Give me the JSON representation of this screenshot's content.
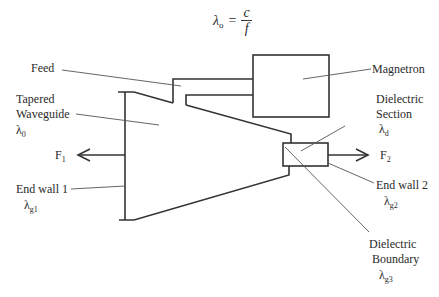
{
  "equation": {
    "lhs_symbol": "λ",
    "lhs_subscript": "o",
    "equals": "=",
    "numerator": "c",
    "denominator": "f"
  },
  "labels": {
    "feed": "Feed",
    "magnetron": "Magnetron",
    "tapered_waveguide_line1": "Tapered",
    "tapered_waveguide_line2": "Waveguide",
    "tapered_waveguide_symbol": "λ",
    "tapered_waveguide_sub": "0",
    "dielectric_section_line1": "Dielectric",
    "dielectric_section_line2": "Section",
    "dielectric_section_symbol": "λ",
    "dielectric_section_sub": "d",
    "f1": "F",
    "f1_sub": "1",
    "f2": "F",
    "f2_sub": "2",
    "end_wall_1": "End wall 1",
    "end_wall_1_symbol": "λ",
    "end_wall_1_sub": "g1",
    "end_wall_2": "End wall 2",
    "end_wall_2_symbol": "λ",
    "end_wall_2_sub": "g2",
    "dielectric_boundary_line1": "Dielectric",
    "dielectric_boundary_line2": "Boundary",
    "dielectric_boundary_symbol": "λ",
    "dielectric_boundary_sub": "g3"
  },
  "colors": {
    "stroke": "#333333",
    "leader": "#444444",
    "background": "#ffffff"
  }
}
